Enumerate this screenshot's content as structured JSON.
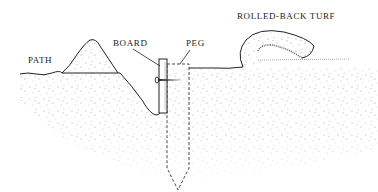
{
  "diagram": {
    "labels": {
      "path": "PATH",
      "board": "BOARD",
      "peg": "PEG",
      "turf": "ROLLED-BACK TURF"
    },
    "colors": {
      "line": "#222222",
      "soil_speckle": "#9a9a9a",
      "background": "#ffffff"
    }
  }
}
